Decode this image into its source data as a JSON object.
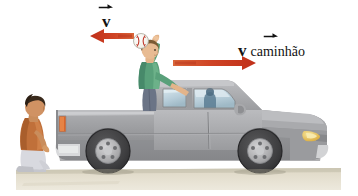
{
  "figure": {
    "background_color": "#ffffff",
    "width": 358,
    "height": 196
  },
  "labels": {
    "ball_velocity": {
      "symbol": "v",
      "subscript": "",
      "full_text": "v",
      "name": "ball-velocity-label",
      "vector_arrow": true,
      "x": 102,
      "y": 13
    },
    "truck_velocity": {
      "symbol": "v",
      "subscript": "caminhão",
      "full_text": "v caminhão",
      "name": "truck-velocity-label",
      "vector_arrow": true,
      "x": 238,
      "y": 42
    }
  },
  "arrows": {
    "ball_arrow": {
      "direction": "left",
      "color": "#c8341f",
      "tail_color": "#d9542f",
      "x": 90,
      "y": 36,
      "length": 44,
      "name": "ball-velocity-arrow"
    },
    "truck_arrow": {
      "direction": "right",
      "color": "#c8341f",
      "tail_color": "#d9542f",
      "x": 173,
      "y": 63,
      "length": 83,
      "name": "truck-velocity-arrow"
    }
  },
  "objects": {
    "ball": {
      "name": "baseball",
      "color": "#f7f5ef",
      "seam_color": "#c0392b",
      "cx": 141,
      "cy": 42,
      "r": 7
    },
    "truck": {
      "name": "pickup-truck",
      "body_color": "#9a9a9c",
      "body_shadow": "#7f8083",
      "body_highlight": "#b5b6b8",
      "window_color": "#bfd2dc",
      "tire_color": "#3c3c3e",
      "rim_color": "#b9b9bb",
      "headlight_color": "#e8c64a",
      "taillight_color": "#d9662a",
      "bumper_color": "#dcdcdc"
    },
    "thrower": {
      "name": "person-throwing-ball",
      "shirt_color": "#59a07a",
      "pants_color": "#6b7486",
      "skin_color": "#e3b48a",
      "hair_color": "#7b5a33"
    },
    "observer": {
      "name": "person-crouching-observer",
      "shirt_color": "#c0703a",
      "pants_color": "#d8d9df",
      "skin_color": "#c98d5c",
      "hair_color": "#3a2a1c"
    },
    "ground": {
      "name": "ground-strip",
      "color": "#e3ddcd",
      "color_top": "#d6d0bf",
      "x": 16,
      "y": 168,
      "width": 325,
      "height": 22
    },
    "driver": {
      "name": "driver-in-cab",
      "color": "#5b7c93"
    }
  }
}
